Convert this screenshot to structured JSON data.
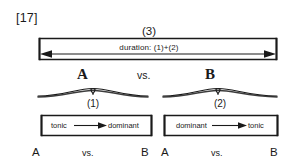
{
  "figure": {
    "number_label": "[17]",
    "top_span": {
      "label": "(3)",
      "inner_text": "duration: (1)+(2)",
      "arrow": "double-headed-horizontal-arrow"
    },
    "comparison_header": {
      "left": "A",
      "operator": "vs.",
      "right": "B"
    },
    "braces": [
      {
        "label": "(1)"
      },
      {
        "label": "(2)"
      }
    ],
    "progressions": [
      {
        "from": "tonic",
        "to": "dominant",
        "arrow": "right-arrow"
      },
      {
        "from": "dominant",
        "to": "tonic",
        "arrow": "right-arrow"
      }
    ],
    "bottom_rows": [
      {
        "left": "A",
        "operator": "vs.",
        "right": "B"
      },
      {
        "left": "A",
        "operator": "vs.",
        "right": "B"
      }
    ],
    "colors": {
      "ink": "#1a1a1a",
      "background": "#ffffff"
    }
  }
}
